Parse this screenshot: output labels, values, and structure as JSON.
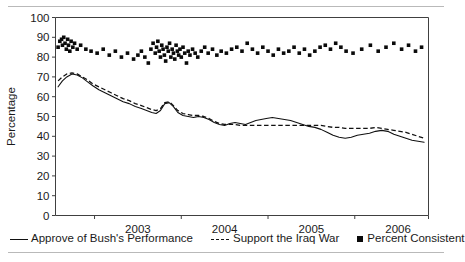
{
  "figure": {
    "has_top_rule": true,
    "has_bottom_rule": true,
    "rule_color": "#b9b9b9"
  },
  "legend": {
    "position": "below-axis",
    "entries": [
      {
        "label": "Approve of Bush's Performance",
        "marker": "solid-line-key",
        "color": "#111111"
      },
      {
        "label": "Support the Iraq War",
        "marker": "dashed-line-key",
        "color": "#111111"
      },
      {
        "label": "Percent Consistent",
        "marker": "square-marker-key",
        "color": "#0a0a0a"
      }
    ]
  },
  "axes": {
    "ylabel": "Percentage",
    "yticks": [
      "0",
      "10",
      "20",
      "30",
      "40",
      "50",
      "60",
      "70",
      "80",
      "90",
      "100"
    ],
    "xticks": [
      "2003",
      "2004",
      "2005",
      "2006"
    ]
  },
  "chart_data": {
    "type": "line",
    "title": "",
    "xlabel": "",
    "ylabel": "Percentage",
    "ylim": [
      0,
      100
    ],
    "xlim": [
      2002.55,
      2006.85
    ],
    "grid": false,
    "legend_position": "bottom",
    "xtick_values": [
      2003,
      2004,
      2005,
      2006
    ],
    "xtick_labels": [
      "2003",
      "2004",
      "2005",
      "2006"
    ],
    "ytick_values": [
      0,
      10,
      20,
      30,
      40,
      50,
      60,
      70,
      80,
      90,
      100
    ],
    "series": [
      {
        "name": "Approve of Bush's Performance",
        "style": "solid",
        "color": "#111111",
        "x": [
          2002.58,
          2002.63,
          2002.68,
          2002.74,
          2002.8,
          2002.86,
          2002.92,
          2002.98,
          2003.05,
          2003.12,
          2003.19,
          2003.26,
          2003.33,
          2003.4,
          2003.47,
          2003.54,
          2003.6,
          2003.66,
          2003.71,
          2003.76,
          2003.81,
          2003.86,
          2003.91,
          2003.96,
          2004.02,
          2004.08,
          2004.14,
          2004.2,
          2004.26,
          2004.32,
          2004.38,
          2004.44,
          2004.5,
          2004.56,
          2004.62,
          2004.68,
          2004.74,
          2004.8,
          2004.86,
          2004.92,
          2004.98,
          2005.05,
          2005.12,
          2005.19,
          2005.26,
          2005.33,
          2005.4,
          2005.47,
          2005.54,
          2005.61,
          2005.68,
          2005.75,
          2005.82,
          2005.89,
          2005.96,
          2006.03,
          2006.1,
          2006.17,
          2006.24,
          2006.31,
          2006.38,
          2006.45,
          2006.52,
          2006.59,
          2006.66,
          2006.73,
          2006.8
        ],
        "y": [
          65,
          68,
          70,
          71.5,
          71,
          69.5,
          67.5,
          65.5,
          63.5,
          62,
          60.5,
          59,
          57.5,
          56.5,
          55,
          54,
          53,
          52,
          51.5,
          53,
          56.5,
          57,
          55,
          52,
          50.5,
          50,
          49.5,
          50,
          49.5,
          48.5,
          47,
          46,
          45.5,
          46.5,
          47,
          46.5,
          46,
          47,
          48,
          48.5,
          49,
          49.5,
          49,
          48.5,
          48,
          47,
          46,
          45,
          44.5,
          43.5,
          42,
          40.5,
          39.5,
          39,
          39.5,
          40.5,
          41,
          41.5,
          42.5,
          43,
          42.5,
          41,
          40,
          39,
          38,
          37.5,
          37
        ]
      },
      {
        "name": "Support the Iraq War",
        "style": "dashed",
        "color": "#111111",
        "x": [
          2002.58,
          2002.63,
          2002.68,
          2002.74,
          2002.8,
          2002.86,
          2002.92,
          2002.98,
          2003.05,
          2003.12,
          2003.19,
          2003.26,
          2003.33,
          2003.4,
          2003.47,
          2003.54,
          2003.6,
          2003.66,
          2003.71,
          2003.76,
          2003.81,
          2003.86,
          2003.91,
          2003.96,
          2004.02,
          2004.08,
          2004.14,
          2004.2,
          2004.26,
          2004.32,
          2004.38,
          2004.44,
          2004.5,
          2004.56,
          2004.62,
          2004.68,
          2004.74,
          2004.8,
          2004.86,
          2004.92,
          2004.98,
          2005.05,
          2005.12,
          2005.19,
          2005.26,
          2005.33,
          2005.4,
          2005.47,
          2005.54,
          2005.61,
          2005.68,
          2005.75,
          2005.82,
          2005.89,
          2005.96,
          2006.03,
          2006.1,
          2006.17,
          2006.24,
          2006.31,
          2006.38,
          2006.45,
          2006.52,
          2006.59,
          2006.66,
          2006.73,
          2006.8
        ],
        "y": [
          68,
          70,
          71.5,
          72,
          71.5,
          70,
          68.5,
          66.5,
          65,
          63.5,
          62,
          60.5,
          59,
          58,
          56.5,
          55.5,
          54.5,
          53.5,
          53,
          54,
          57,
          57.5,
          55.5,
          53,
          51.5,
          51,
          50.5,
          50.5,
          50,
          49,
          47.5,
          46.5,
          46,
          46,
          46,
          45.5,
          45.5,
          45.5,
          45.5,
          45.5,
          45.5,
          45.5,
          45.5,
          45.5,
          45.5,
          45.5,
          45.5,
          45.5,
          45.5,
          45.5,
          45,
          44.5,
          44.5,
          44,
          44,
          44,
          44,
          44,
          44.5,
          44,
          43.5,
          43,
          42.5,
          42,
          41,
          40,
          39
        ]
      },
      {
        "name": "Percent Consistent",
        "style": "scatter-square",
        "color": "#0a0a0a",
        "x": [
          2002.58,
          2002.6,
          2002.62,
          2002.63,
          2002.645,
          2002.66,
          2002.675,
          2002.69,
          2002.7,
          2002.715,
          2002.73,
          2002.75,
          2002.77,
          2002.8,
          2002.84,
          2002.9,
          2002.96,
          2003.03,
          2003.1,
          2003.17,
          2003.24,
          2003.31,
          2003.38,
          2003.45,
          2003.5,
          2003.54,
          2003.58,
          2003.62,
          2003.65,
          2003.675,
          2003.7,
          2003.715,
          2003.73,
          2003.745,
          2003.76,
          2003.775,
          2003.79,
          2003.805,
          2003.82,
          2003.835,
          2003.85,
          2003.865,
          2003.88,
          2003.895,
          2003.91,
          2003.925,
          2003.94,
          2003.955,
          2003.97,
          2003.985,
          2004.0,
          2004.02,
          2004.04,
          2004.06,
          2004.08,
          2004.1,
          2004.13,
          2004.16,
          2004.19,
          2004.23,
          2004.27,
          2004.31,
          2004.36,
          2004.41,
          2004.46,
          2004.52,
          2004.58,
          2004.64,
          2004.7,
          2004.76,
          2004.82,
          2004.88,
          2004.94,
          2005.0,
          2005.06,
          2005.12,
          2005.18,
          2005.24,
          2005.3,
          2005.36,
          2005.42,
          2005.48,
          2005.54,
          2005.6,
          2005.66,
          2005.72,
          2005.78,
          2005.84,
          2005.9,
          2005.98,
          2006.08,
          2006.18,
          2006.27,
          2006.36,
          2006.45,
          2006.54,
          2006.62,
          2006.7,
          2006.77
        ],
        "y": [
          85,
          88,
          89,
          86,
          90,
          87,
          84,
          89,
          86,
          83,
          88,
          85,
          87,
          84,
          86,
          84,
          83,
          82,
          84,
          81,
          83,
          80,
          82,
          79,
          81,
          83,
          80,
          77,
          84,
          87,
          82,
          85,
          88,
          83,
          80,
          86,
          84,
          81,
          78,
          85,
          83,
          87,
          80,
          84,
          82,
          79,
          86,
          83,
          81,
          84,
          80,
          85,
          82,
          77,
          83,
          81,
          84,
          82,
          80,
          83,
          85,
          82,
          84,
          81,
          83,
          82,
          84,
          85,
          83,
          87,
          84,
          82,
          85,
          83,
          81,
          84,
          82,
          83,
          85,
          82,
          84,
          81,
          83,
          85,
          86,
          84,
          87,
          85,
          83,
          82,
          84,
          86,
          83,
          85,
          87,
          84,
          86,
          83,
          85
        ]
      }
    ]
  }
}
